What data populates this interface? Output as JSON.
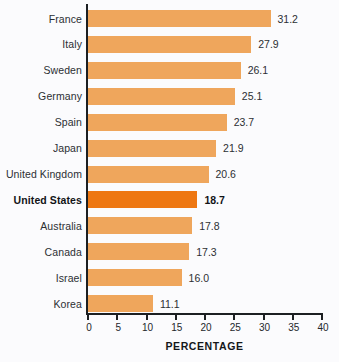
{
  "chart_data": {
    "type": "bar",
    "orientation": "horizontal",
    "title": "",
    "xlabel": "PERCENTAGE",
    "ylabel": "",
    "xlim": [
      0,
      40
    ],
    "xticks": [
      0,
      5,
      10,
      15,
      20,
      25,
      30,
      35,
      40
    ],
    "xtick_labels": [
      "0",
      "5",
      "10",
      "15",
      "20",
      "25",
      "30",
      "35",
      "40"
    ],
    "grid": false,
    "legend": null,
    "categories": [
      "France",
      "Italy",
      "Sweden",
      "Germany",
      "Spain",
      "Japan",
      "United Kingdom",
      "United States",
      "Australia",
      "Canada",
      "Israel",
      "Korea"
    ],
    "values": [
      31.2,
      27.9,
      26.1,
      25.1,
      23.7,
      21.9,
      20.6,
      18.7,
      17.8,
      17.3,
      16.0,
      11.1
    ],
    "value_labels": [
      "31.2",
      "27.9",
      "26.1",
      "25.1",
      "23.7",
      "21.9",
      "20.6",
      "18.7",
      "17.8",
      "17.3",
      "16.0",
      "11.1"
    ],
    "highlighted_category": "United States",
    "bars": [
      {
        "label": "France",
        "value": 31.2,
        "value_label": "31.2",
        "highlight": false
      },
      {
        "label": "Italy",
        "value": 27.9,
        "value_label": "27.9",
        "highlight": false
      },
      {
        "label": "Sweden",
        "value": 26.1,
        "value_label": "26.1",
        "highlight": false
      },
      {
        "label": "Germany",
        "value": 25.1,
        "value_label": "25.1",
        "highlight": false
      },
      {
        "label": "Spain",
        "value": 23.7,
        "value_label": "23.7",
        "highlight": false
      },
      {
        "label": "Japan",
        "value": 21.9,
        "value_label": "21.9",
        "highlight": false
      },
      {
        "label": "United Kingdom",
        "value": 20.6,
        "value_label": "20.6",
        "highlight": false
      },
      {
        "label": "United States",
        "value": 18.7,
        "value_label": "18.7",
        "highlight": true
      },
      {
        "label": "Australia",
        "value": 17.8,
        "value_label": "17.8",
        "highlight": false
      },
      {
        "label": "Canada",
        "value": 17.3,
        "value_label": "17.3",
        "highlight": false
      },
      {
        "label": "Israel",
        "value": 16.0,
        "value_label": "16.0",
        "highlight": false
      },
      {
        "label": "Korea",
        "value": 11.1,
        "value_label": "11.1",
        "highlight": false
      }
    ],
    "colors": {
      "bar": "#efa65c",
      "bar_highlight": "#ee7712",
      "axis": "#1c1f22",
      "text": "#2c2f33",
      "background": "#fbfbfd"
    }
  }
}
